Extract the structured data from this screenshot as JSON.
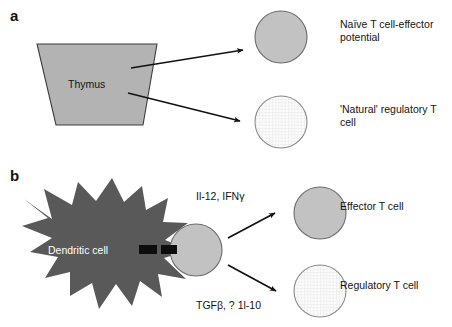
{
  "figure": {
    "type": "diagram",
    "panels": [
      {
        "id": "a",
        "label": "a",
        "source_shape": {
          "name": "thymus",
          "text": "Thymus",
          "shape": "trapezoid",
          "fill": "#b3b3b3"
        },
        "outputs": [
          {
            "name": "naive-t-cell",
            "label": "Naïve T cell-effector\npotential",
            "fill": "solid-gray"
          },
          {
            "name": "natural-treg",
            "label": "'Natural' regulatory T\ncell",
            "fill": "grid-hatch"
          }
        ]
      },
      {
        "id": "b",
        "label": "b",
        "source_shape": {
          "name": "dendritic-cell",
          "text": "Dendritic cell",
          "shape": "star-burst",
          "fill": "#595959"
        },
        "intermediate": {
          "name": "t-cell",
          "fill": "solid-gray"
        },
        "arrows": [
          {
            "name": "effector-pathway",
            "cytokines": "Il-12, IFNγ"
          },
          {
            "name": "regulatory-pathway",
            "cytokines": "TGFβ, ? 1l-10"
          }
        ],
        "outputs": [
          {
            "name": "effector-t-cell",
            "label": "Effector T cell",
            "fill": "solid-gray"
          },
          {
            "name": "regulatory-t-cell",
            "label": "Regulatory T cell",
            "fill": "grid-hatch"
          }
        ]
      }
    ],
    "colors": {
      "thymus_fill": "#b3b3b3",
      "thymus_stroke": "#3d3d3d",
      "dendritic_fill": "#595959",
      "cell_solid_fill": "#c2c2c2",
      "cell_solid_stroke": "#6b6b6b",
      "cell_grid_fill": "#fbfbfb",
      "cell_grid_stroke": "#8a8a8a",
      "grid_line": "#d8d8d8",
      "arrow": "#121212",
      "synapse": "#0d0d0d",
      "text": "#141414",
      "background": "#ffffff"
    }
  }
}
